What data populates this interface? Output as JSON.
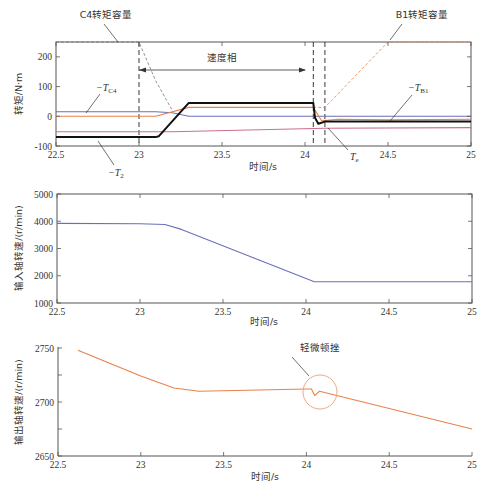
{
  "colors": {
    "blue": "#6b6fb8",
    "orange": "#e8824a",
    "pink": "#c9708a",
    "black": "#111111",
    "capacity_c4": "#777777",
    "capacity_b1": "#e8824a",
    "circle": "#e8a07a",
    "axis": "#555555"
  },
  "chart_data": [
    {
      "id": "torque",
      "type": "line",
      "xlabel": "时间/s",
      "ylabel": "转矩/N·m",
      "xlim": [
        22.5,
        25
      ],
      "ylim": [
        -100,
        250
      ],
      "xticks": [
        22.5,
        23,
        23.5,
        24,
        24.5,
        25
      ],
      "xtick_labels": [
        "22.5",
        "23",
        "23.5",
        "24",
        "24.5",
        "25"
      ],
      "yticks": [
        -100,
        0,
        100,
        200
      ],
      "ytick_labels": [
        "-100",
        "0",
        "100",
        "200"
      ],
      "grid": false,
      "vlines": [
        23.0,
        24.05,
        24.12
      ],
      "series": [
        {
          "name": "C4转矩容量",
          "color_key": "capacity_c4",
          "dash": true,
          "x": [
            22.5,
            23.0,
            23.1,
            23.2
          ],
          "y": [
            250,
            250,
            120,
            20
          ]
        },
        {
          "name": "B1转矩容量",
          "color_key": "capacity_b1",
          "dash": true,
          "x": [
            24.05,
            24.12,
            24.5,
            25.0
          ],
          "y": [
            30,
            30,
            250,
            250
          ]
        },
        {
          "name": "-T_C4",
          "color_key": "blue",
          "dash": false,
          "x": [
            22.5,
            23.1,
            23.2,
            23.3,
            25.0
          ],
          "y": [
            15,
            15,
            12,
            0,
            0
          ]
        },
        {
          "name": "-T_B1",
          "color_key": "orange",
          "dash": false,
          "x": [
            22.5,
            23.1,
            23.3,
            24.05,
            24.1,
            24.2,
            24.5,
            25.0
          ],
          "y": [
            0,
            0,
            30,
            30,
            -15,
            -10,
            -12,
            -10
          ]
        },
        {
          "name": "-T_2",
          "color_key": "pink",
          "dash": false,
          "x": [
            22.5,
            23.2,
            24.12,
            25.0
          ],
          "y": [
            -52,
            -52,
            -40,
            -38
          ]
        },
        {
          "name": "T_e",
          "color_key": "black",
          "dash": false,
          "x": [
            22.5,
            23.1,
            23.12,
            23.3,
            24.05,
            24.06,
            24.08,
            24.12,
            25.0
          ],
          "y": [
            -70,
            -70,
            -67,
            45,
            45,
            -5,
            -25,
            -18,
            -18
          ]
        }
      ],
      "annotations": {
        "c4_capacity": "C4转矩容量",
        "b1_capacity": "B1转矩容量",
        "speed_phase": "速度相",
        "t_c4_prefix": "−T",
        "t_c4_sub": "C4",
        "t_b1_prefix": "−T",
        "t_b1_sub": "B1",
        "t_2_prefix": "−T",
        "t_2_sub": "2",
        "t_e_prefix": "T",
        "t_e_sub": "e"
      }
    },
    {
      "id": "input-speed",
      "type": "line",
      "xlabel": "时间/s",
      "ylabel": "输入轴转速/(r/min)",
      "xlim": [
        22.5,
        25
      ],
      "ylim": [
        1000,
        5000
      ],
      "xticks": [
        22.5,
        23,
        23.5,
        24,
        24.5,
        25
      ],
      "xtick_labels": [
        "22.5",
        "23",
        "23.5",
        "24",
        "24.5",
        "25"
      ],
      "yticks": [
        1000,
        2000,
        3000,
        4000,
        5000
      ],
      "ytick_labels": [
        "1000",
        "2000",
        "3000",
        "4000",
        "5000"
      ],
      "grid": false,
      "series": [
        {
          "name": "输入轴转速",
          "color_key": "blue",
          "x": [
            22.5,
            23.0,
            23.15,
            23.25,
            24.05,
            25.0
          ],
          "y": [
            3920,
            3910,
            3880,
            3700,
            1780,
            1780
          ]
        }
      ]
    },
    {
      "id": "output-speed",
      "type": "line",
      "xlabel": "时间/s",
      "ylabel": "输出轴转速/(r/min)",
      "xlim": [
        22.5,
        25
      ],
      "ylim": [
        2650,
        2750
      ],
      "xticks": [
        22.5,
        23,
        23.5,
        24,
        24.5,
        25
      ],
      "xtick_labels": [
        "22.5",
        "23",
        "23.5",
        "24",
        "24.5",
        "25"
      ],
      "yticks": [
        2650,
        2700,
        2750
      ],
      "ytick_labels": [
        "2650",
        "2700",
        "2750"
      ],
      "minor_yticks": [
        2675,
        2725
      ],
      "grid": false,
      "series": [
        {
          "name": "输出轴转速",
          "color_key": "orange",
          "x": [
            22.62,
            23.0,
            23.2,
            23.35,
            24.0,
            24.03,
            24.05,
            24.08,
            25.0
          ],
          "y": [
            2748,
            2724,
            2713,
            2710,
            2712,
            2712,
            2706,
            2710,
            2675
          ]
        }
      ],
      "annotations": {
        "jerk": "轻微顿挫"
      }
    }
  ]
}
